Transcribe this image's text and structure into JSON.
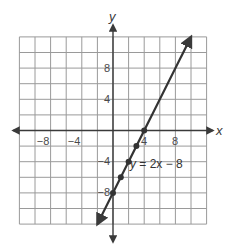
{
  "chart_data": {
    "type": "line",
    "title": "",
    "xlabel": "x",
    "ylabel": "y",
    "xlim": [
      -12,
      12
    ],
    "ylim": [
      -12,
      12
    ],
    "grid": true,
    "grid_step": 2,
    "x_tick_labels": [
      {
        "value": -8,
        "label": "−8"
      },
      {
        "value": -4,
        "label": "−4"
      },
      {
        "value": 4,
        "label": "4"
      },
      {
        "value": 8,
        "label": "8"
      }
    ],
    "y_tick_labels": [
      {
        "value": 8,
        "label": "8"
      },
      {
        "value": 4,
        "label": "4"
      },
      {
        "value": -4,
        "label": "−4"
      },
      {
        "value": -8,
        "label": "−8"
      }
    ],
    "series": [
      {
        "name": "y = 2x − 8",
        "equation": "y = 2x − 8",
        "slope": 2,
        "intercept": -8,
        "line_from": [
          -2,
          -12
        ],
        "line_to": [
          10,
          12
        ],
        "arrows": "both",
        "points": [
          [
            0,
            -8
          ],
          [
            1,
            -6
          ],
          [
            2,
            -4
          ],
          [
            3,
            -2
          ],
          [
            4,
            0
          ]
        ],
        "color": "#333333"
      }
    ],
    "annotations": [
      {
        "text": "y = 2x − 8",
        "x": 3,
        "y": -4
      }
    ]
  },
  "labels": {
    "x_axis": "x",
    "y_axis": "y",
    "equation_prefix": "y",
    "equation_rest": " = 2x − 8",
    "tick_x_m8": "−8",
    "tick_x_m4": "−4",
    "tick_x_4": "4",
    "tick_x_8": "8",
    "tick_y_8": "8",
    "tick_y_4": "4",
    "tick_y_m4": "−4",
    "tick_y_m8": "−8"
  },
  "colors": {
    "grid": "#9a9a9a",
    "axis": "#3a3a3a",
    "line": "#333333"
  }
}
